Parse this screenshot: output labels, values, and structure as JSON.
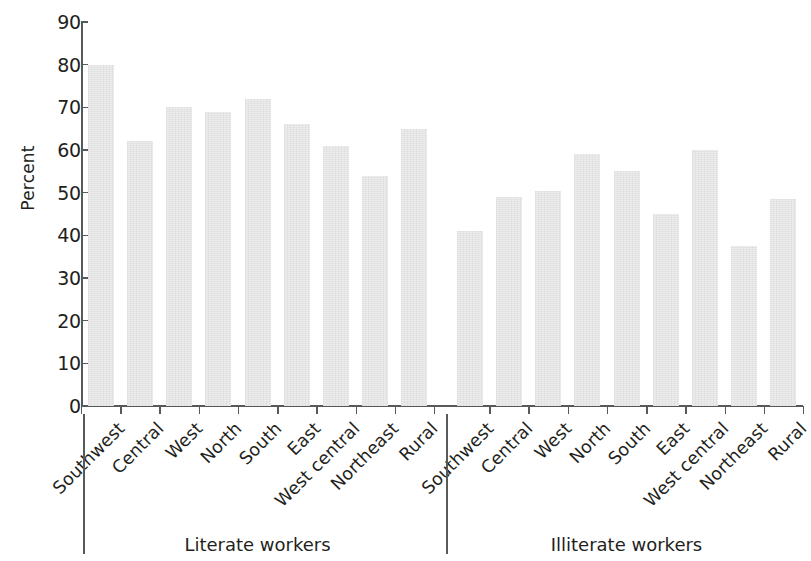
{
  "chart_data": {
    "type": "bar",
    "title": "",
    "xlabel": "",
    "ylabel": "Percent",
    "ylim": [
      0,
      90
    ],
    "ytick_step": 10,
    "yticks": [
      "0",
      "10",
      "20",
      "30",
      "40",
      "50",
      "60",
      "70",
      "80",
      "90"
    ],
    "grid": false,
    "legend": "none",
    "bar_color": "#ededee",
    "axis_color": "#58595b",
    "text_color": "#231f20",
    "groups": [
      {
        "name": "Literate workers",
        "categories": [
          "Southwest",
          "Central",
          "West",
          "North",
          "South",
          "East",
          "West central",
          "Northeast",
          "Rural"
        ],
        "values": [
          80,
          62,
          70,
          69,
          72,
          66,
          61,
          54,
          65
        ]
      },
      {
        "name": "Illiterate workers",
        "categories": [
          "Southwest",
          "Central",
          "West",
          "North",
          "South",
          "East",
          "West central",
          "Northeast",
          "Rural"
        ],
        "values": [
          41,
          49,
          50.5,
          59,
          55,
          45,
          60,
          37.5,
          48.5
        ]
      }
    ]
  }
}
